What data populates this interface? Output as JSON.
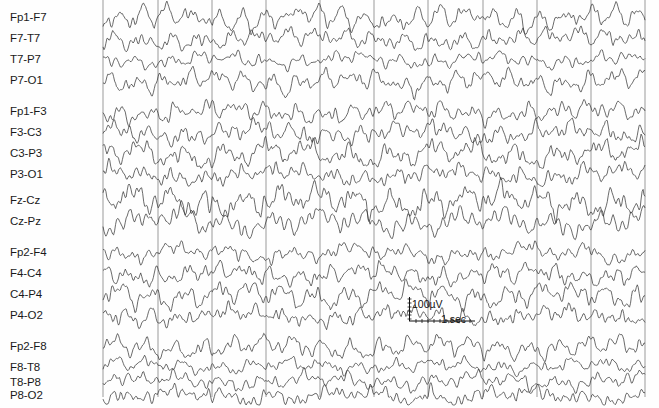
{
  "recording": {
    "title": "EEG bipolar longitudinal montage recording",
    "background_color": "#fefefe",
    "trace_color": "#3a3a3a",
    "grid_color": "#9a9a9a"
  },
  "calibration": {
    "amplitude_label": "100µV",
    "time_label": "1 sec",
    "amplitude_value": 100,
    "amplitude_units": "µV",
    "time_value": 1,
    "time_units": "sec"
  },
  "channels": [
    {
      "label": "Fp1-F7",
      "group": 1,
      "y": 18
    },
    {
      "label": "F7-T7",
      "group": 1,
      "y": 39
    },
    {
      "label": "T7-P7",
      "group": 1,
      "y": 60
    },
    {
      "label": "P7-O1",
      "group": 1,
      "y": 81
    },
    {
      "label": "Fp1-F3",
      "group": 2,
      "y": 112
    },
    {
      "label": "F3-C3",
      "group": 2,
      "y": 133
    },
    {
      "label": "C3-P3",
      "group": 2,
      "y": 154
    },
    {
      "label": "P3-O1",
      "group": 2,
      "y": 175
    },
    {
      "label": "Fz-Cz",
      "group": 3,
      "y": 201
    },
    {
      "label": "Cz-Pz",
      "group": 3,
      "y": 222
    },
    {
      "label": "Fp2-F4",
      "group": 4,
      "y": 253
    },
    {
      "label": "F4-C4",
      "group": 4,
      "y": 274
    },
    {
      "label": "C4-P4",
      "group": 4,
      "y": 295
    },
    {
      "label": "P4-O2",
      "group": 4,
      "y": 316
    },
    {
      "label": "Fp2-F8",
      "group": 5,
      "y": 347
    },
    {
      "label": "F8-T8",
      "group": 5,
      "y": 368
    },
    {
      "label": "T8-P8",
      "group": 5,
      "y": 383
    },
    {
      "label": "P8-O2",
      "group": 5,
      "y": 396
    }
  ],
  "chart_data": {
    "type": "line",
    "xlabel": "",
    "ylabel": "",
    "grid": true,
    "legend": "none",
    "x_axis": {
      "units": "sec",
      "gridline_positions_px": [
        103,
        158,
        212,
        266,
        320,
        374,
        428,
        483,
        537,
        591,
        645
      ],
      "gridline_interval_sec": 1,
      "plot_left_px": 103,
      "plot_right_px": 645,
      "total_duration_sec": 10
    },
    "y_axis": {
      "units": "µV",
      "calibration_height_px": 22,
      "calibration_value": 100
    },
    "series": [
      {
        "name": "Fp1-F7",
        "baseline_y": 18,
        "amplitude": 7.5,
        "seed": 11
      },
      {
        "name": "F7-T7",
        "baseline_y": 39,
        "amplitude": 6.5,
        "seed": 23
      },
      {
        "name": "T7-P7",
        "baseline_y": 60,
        "amplitude": 6.0,
        "seed": 37
      },
      {
        "name": "P7-O1",
        "baseline_y": 81,
        "amplitude": 7.0,
        "seed": 51
      },
      {
        "name": "Fp1-F3",
        "baseline_y": 112,
        "amplitude": 7.0,
        "seed": 67
      },
      {
        "name": "F3-C3",
        "baseline_y": 133,
        "amplitude": 8.0,
        "seed": 79
      },
      {
        "name": "C3-P3",
        "baseline_y": 154,
        "amplitude": 8.5,
        "seed": 93
      },
      {
        "name": "P3-O1",
        "baseline_y": 175,
        "amplitude": 8.0,
        "seed": 107
      },
      {
        "name": "Fz-Cz",
        "baseline_y": 201,
        "amplitude": 9.0,
        "seed": 121
      },
      {
        "name": "Cz-Pz",
        "baseline_y": 222,
        "amplitude": 8.5,
        "seed": 133
      },
      {
        "name": "Fp2-F4",
        "baseline_y": 253,
        "amplitude": 6.5,
        "seed": 147
      },
      {
        "name": "F4-C4",
        "baseline_y": 274,
        "amplitude": 8.0,
        "seed": 159
      },
      {
        "name": "C4-P4",
        "baseline_y": 295,
        "amplitude": 8.0,
        "seed": 173
      },
      {
        "name": "P4-O2",
        "baseline_y": 316,
        "amplitude": 7.5,
        "seed": 187
      },
      {
        "name": "Fp2-F8",
        "baseline_y": 347,
        "amplitude": 7.0,
        "seed": 201
      },
      {
        "name": "F8-T8",
        "baseline_y": 366,
        "amplitude": 5.0,
        "seed": 213
      },
      {
        "name": "T8-P8",
        "baseline_y": 381,
        "amplitude": 6.0,
        "seed": 227
      },
      {
        "name": "P8-O2",
        "baseline_y": 396,
        "amplitude": 6.5,
        "seed": 241
      }
    ]
  }
}
